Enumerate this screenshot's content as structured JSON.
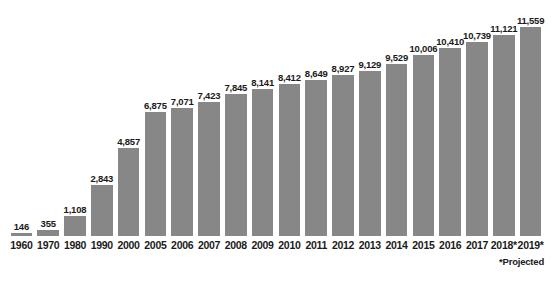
{
  "chart_data": {
    "type": "bar",
    "title": "",
    "subtitle": "",
    "xlabel": "",
    "ylabel": "",
    "grid": false,
    "legend": null,
    "ylim": [
      0,
      11559
    ],
    "bar_color": "#878787",
    "text_color": "#1a1a1a",
    "background": "#ffffff",
    "categories": [
      "1960",
      "1970",
      "1980",
      "1990",
      "2000",
      "2005",
      "2006",
      "2007",
      "2008",
      "2009",
      "2010",
      "2011",
      "2012",
      "2013",
      "2014",
      "2015",
      "2016",
      "2017",
      "2018*",
      "2019*"
    ],
    "values": [
      146,
      355,
      1108,
      2843,
      4857,
      6875,
      7071,
      7423,
      7845,
      8141,
      8412,
      8649,
      8927,
      9129,
      9529,
      10006,
      10410,
      10739,
      11121,
      11559
    ],
    "value_labels": [
      "146",
      "355",
      "1,108",
      "2,843",
      "4,857",
      "6,875",
      "7,071",
      "7,423",
      "7,845",
      "8,141",
      "8,412",
      "8,649",
      "8,927",
      "9,129",
      "9,529",
      "10,006",
      "10,410",
      "10,739",
      "11,121",
      "11,559"
    ],
    "annotations": [
      "*Projected"
    ]
  },
  "footnote": "*Projected"
}
